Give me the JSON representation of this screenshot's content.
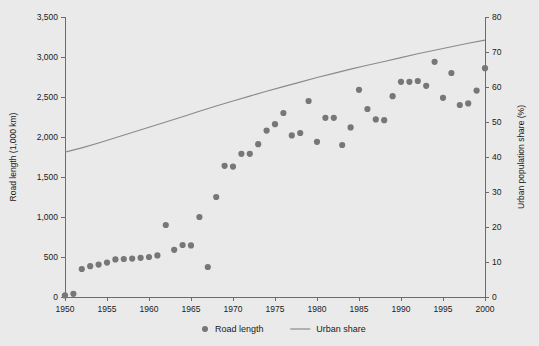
{
  "figure": {
    "background_color": "#eaeaea",
    "plot_background_color": "#eaeaea"
  },
  "chart_data": {
    "type": "scatter",
    "title": "",
    "subtitle": "",
    "xlabel": "",
    "ylabel": "Road length (1,000 km)",
    "y2label": "Urban population share (%)",
    "xlim": [
      1950,
      2000
    ],
    "ylim": [
      0,
      3500
    ],
    "y2lim": [
      0,
      80
    ],
    "grid": false,
    "legend_position": "bottom-center",
    "x_ticks": [
      1950,
      1955,
      1960,
      1965,
      1970,
      1975,
      1980,
      1985,
      1990,
      1995,
      2000
    ],
    "x_tick_labels": [
      "1950",
      "1955",
      "1960",
      "1965",
      "1970",
      "1975",
      "1980",
      "1985",
      "1990",
      "1995",
      "2000"
    ],
    "y_ticks": [
      0,
      500,
      1000,
      1500,
      2000,
      2500,
      3000,
      3500
    ],
    "y_tick_labels": [
      "0",
      "500",
      "1,000",
      "1,500",
      "2,000",
      "2,500",
      "3,000",
      "3,500"
    ],
    "y2_ticks": [
      0,
      10,
      20,
      30,
      40,
      50,
      60,
      70,
      80
    ],
    "y2_tick_labels": [
      "0",
      "10",
      "20",
      "30",
      "40",
      "50",
      "60",
      "70",
      "80"
    ],
    "series": [
      {
        "name": "Road length",
        "type": "scatter",
        "axis": "left",
        "marker": "circle",
        "color": "#777777",
        "unit": "1,000 km",
        "points": [
          {
            "x": 1950,
            "y": 20
          },
          {
            "x": 1951,
            "y": 40
          },
          {
            "x": 1952,
            "y": 350
          },
          {
            "x": 1953,
            "y": 385
          },
          {
            "x": 1954,
            "y": 405
          },
          {
            "x": 1955,
            "y": 430
          },
          {
            "x": 1956,
            "y": 470
          },
          {
            "x": 1957,
            "y": 475
          },
          {
            "x": 1958,
            "y": 480
          },
          {
            "x": 1959,
            "y": 490
          },
          {
            "x": 1960,
            "y": 500
          },
          {
            "x": 1961,
            "y": 520
          },
          {
            "x": 1962,
            "y": 900
          },
          {
            "x": 1963,
            "y": 590
          },
          {
            "x": 1964,
            "y": 650
          },
          {
            "x": 1965,
            "y": 645
          },
          {
            "x": 1966,
            "y": 1000
          },
          {
            "x": 1967,
            "y": 375
          },
          {
            "x": 1968,
            "y": 1250
          },
          {
            "x": 1969,
            "y": 1640
          },
          {
            "x": 1970,
            "y": 1630
          },
          {
            "x": 1971,
            "y": 1790
          },
          {
            "x": 1972,
            "y": 1790
          },
          {
            "x": 1973,
            "y": 1910
          },
          {
            "x": 1974,
            "y": 2080
          },
          {
            "x": 1975,
            "y": 2160
          },
          {
            "x": 1976,
            "y": 2300
          },
          {
            "x": 1977,
            "y": 2020
          },
          {
            "x": 1978,
            "y": 2050
          },
          {
            "x": 1979,
            "y": 2450
          },
          {
            "x": 1980,
            "y": 1940
          },
          {
            "x": 1981,
            "y": 2240
          },
          {
            "x": 1982,
            "y": 2240
          },
          {
            "x": 1983,
            "y": 1900
          },
          {
            "x": 1984,
            "y": 2120
          },
          {
            "x": 1985,
            "y": 2590
          },
          {
            "x": 1986,
            "y": 2350
          },
          {
            "x": 1987,
            "y": 2220
          },
          {
            "x": 1988,
            "y": 2210
          },
          {
            "x": 1989,
            "y": 2510
          },
          {
            "x": 1990,
            "y": 2690
          },
          {
            "x": 1991,
            "y": 2690
          },
          {
            "x": 1992,
            "y": 2700
          },
          {
            "x": 1993,
            "y": 2640
          },
          {
            "x": 1994,
            "y": 2940
          },
          {
            "x": 1995,
            "y": 2490
          },
          {
            "x": 1996,
            "y": 2800
          },
          {
            "x": 1997,
            "y": 2400
          },
          {
            "x": 1998,
            "y": 2420
          },
          {
            "x": 1999,
            "y": 2580
          },
          {
            "x": 2000,
            "y": 2860
          }
        ]
      },
      {
        "name": "Urban share",
        "type": "line",
        "axis": "right",
        "color": "#8a8a8a",
        "unit": "%",
        "points": [
          {
            "x": 1950,
            "y": 41.4
          },
          {
            "x": 1952,
            "y": 42.6
          },
          {
            "x": 1954,
            "y": 44.0
          },
          {
            "x": 1956,
            "y": 45.5
          },
          {
            "x": 1958,
            "y": 47.0
          },
          {
            "x": 1960,
            "y": 48.5
          },
          {
            "x": 1962,
            "y": 50.0
          },
          {
            "x": 1964,
            "y": 51.5
          },
          {
            "x": 1966,
            "y": 53.1
          },
          {
            "x": 1968,
            "y": 54.6
          },
          {
            "x": 1970,
            "y": 56.0
          },
          {
            "x": 1972,
            "y": 57.4
          },
          {
            "x": 1974,
            "y": 58.8
          },
          {
            "x": 1976,
            "y": 60.1
          },
          {
            "x": 1978,
            "y": 61.4
          },
          {
            "x": 1980,
            "y": 62.7
          },
          {
            "x": 1982,
            "y": 63.9
          },
          {
            "x": 1984,
            "y": 65.1
          },
          {
            "x": 1986,
            "y": 66.2
          },
          {
            "x": 1988,
            "y": 67.3
          },
          {
            "x": 1990,
            "y": 68.4
          },
          {
            "x": 1992,
            "y": 69.5
          },
          {
            "x": 1994,
            "y": 70.5
          },
          {
            "x": 1996,
            "y": 71.5
          },
          {
            "x": 1998,
            "y": 72.5
          },
          {
            "x": 2000,
            "y": 73.4
          }
        ]
      }
    ]
  },
  "legend": {
    "items": [
      {
        "label": "Road length",
        "marker": "dot",
        "color": "#777777"
      },
      {
        "label": "Urban share",
        "marker": "line",
        "color": "#8a8a8a"
      }
    ]
  }
}
